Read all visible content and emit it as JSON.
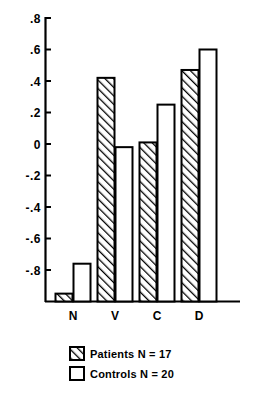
{
  "chart_data": {
    "type": "bar",
    "title": "",
    "subtitle": "",
    "xlabel": "",
    "ylabel": "",
    "categories": [
      "N",
      "V",
      "C",
      "D"
    ],
    "series": [
      {
        "name": "Patients N = 17",
        "fill": "hatched",
        "values": [
          -0.95,
          0.42,
          0.01,
          0.47
        ]
      },
      {
        "name": "Controls N = 20",
        "fill": "open",
        "values": [
          -0.76,
          -0.02,
          0.25,
          0.6
        ]
      }
    ],
    "ylim": [
      -1.0,
      0.8
    ],
    "yticks": [
      0.8,
      0.6,
      0.4,
      0.2,
      0.0,
      -0.2,
      -0.4,
      -0.6,
      -0.8
    ],
    "ytick_labels": [
      ".8",
      ".6",
      ".4",
      ".2",
      "0",
      "-.2",
      "-.4",
      "-.6",
      "-.8"
    ],
    "grid": false,
    "baseline_value": -1.0,
    "legend_position": "bottom-center",
    "axis_color": "#000000",
    "bar_stroke_color": "#000000",
    "bar_open_fill": "#ffffff"
  },
  "legend": {
    "entries": [
      {
        "label": "Patients N = 17",
        "swatch": "hatched"
      },
      {
        "label": "Controls N = 20",
        "swatch": "open"
      }
    ]
  },
  "axis": {
    "y_tick_labels": [
      ".8",
      ".6",
      ".4",
      ".2",
      "0",
      "-.2",
      "-.4",
      "-.6",
      "-.8"
    ],
    "x_tick_labels": [
      "N",
      "V",
      "C",
      "D"
    ]
  }
}
